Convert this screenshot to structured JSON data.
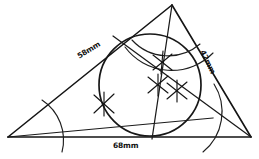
{
  "figure": {
    "type": "geometric-construction",
    "canvas": {
      "width": 259,
      "height": 159
    },
    "background_color": "#ffffff",
    "ink_color": "#141414"
  },
  "dimensions": {
    "left_side": {
      "label": "58mm",
      "value": 58,
      "unit": "mm"
    },
    "right_side": {
      "label": "42mm",
      "value": 42,
      "unit": "mm"
    },
    "base": {
      "label": "68mm",
      "value": 68,
      "unit": "mm"
    }
  },
  "triangle": {
    "vertices": {
      "left": {
        "x": 8,
        "y": 137
      },
      "apex": {
        "x": 172,
        "y": 5
      },
      "right": {
        "x": 251,
        "y": 137
      }
    }
  },
  "incircle": {
    "center": {
      "x": 150,
      "y": 85
    },
    "radius": 51
  },
  "incenter_marks": [
    {
      "x": 162,
      "y": 62
    },
    {
      "x": 158,
      "y": 85
    },
    {
      "x": 177,
      "y": 91
    }
  ],
  "bisector_marks": [
    {
      "x": 104,
      "y": 104
    }
  ]
}
